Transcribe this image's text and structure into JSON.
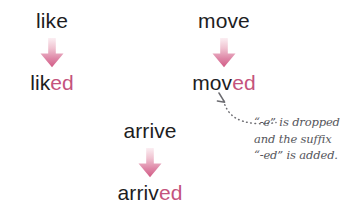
{
  "diagram": {
    "groups": [
      {
        "id": "like",
        "base_word": "like",
        "result_stem": "lik",
        "result_suffix": "ed",
        "arrow_icon": "down-arrow-icon"
      },
      {
        "id": "move",
        "base_word": "move",
        "result_stem": "mov",
        "result_suffix": "ed",
        "arrow_icon": "down-arrow-icon"
      },
      {
        "id": "arrive",
        "base_word": "arrive",
        "result_stem": "arriv",
        "result_suffix": "ed",
        "arrow_icon": "down-arrow-icon"
      }
    ],
    "annotation": {
      "pointer_icon": "dotted-curved-arrow-icon",
      "lines": [
        "“-e” is dropped",
        "and the suffix",
        "“-ed” is added."
      ]
    },
    "colors": {
      "background": "#ffffff",
      "base_text": "#1d1d1f",
      "suffix_text": "#c4537d",
      "arrow_light": "#f7dde5",
      "arrow_dark": "#d4628a",
      "annotation_text": "#56565c",
      "pointer": "#6b6b70"
    }
  }
}
